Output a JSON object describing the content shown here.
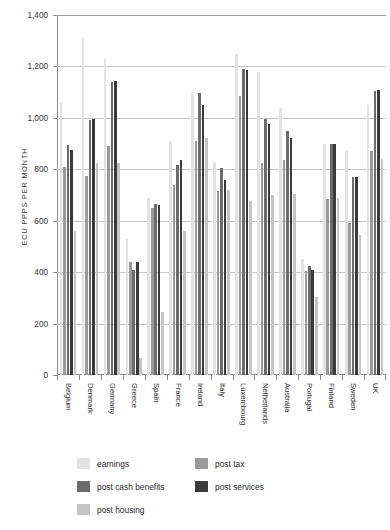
{
  "chart_data": {
    "type": "bar",
    "title": "",
    "subtitle": "",
    "xlabel": "",
    "ylabel": "ECU PPPS PER MONTH",
    "ylim": [
      0,
      1400
    ],
    "ytick_step": 200,
    "ytick_labels": [
      "1,400",
      "1,200",
      "1,000",
      "800",
      "600",
      "400",
      "200",
      "0"
    ],
    "ytick_values": [
      1400,
      1200,
      1000,
      800,
      600,
      400,
      200,
      0
    ],
    "grid": true,
    "grid_axis": "y",
    "legend_position": "below-plot",
    "categories": [
      "Belgium",
      "Denmark",
      "Germany",
      "Greece",
      "Spain",
      "France",
      "Ireland",
      "Italy",
      "Luxembourg",
      "Netherlands",
      "Australia",
      "Portugal",
      "Finland",
      "Sweden",
      "UK"
    ],
    "series": [
      {
        "name": "earnings",
        "color": "#e2e2e2",
        "values": [
          1060,
          1305,
          1230,
          530,
          690,
          910,
          1100,
          830,
          1250,
          1180,
          1040,
          450,
          900,
          870,
          1050
        ]
      },
      {
        "name": "post tax",
        "color": "#9a9a9a",
        "values": [
          810,
          775,
          890,
          440,
          650,
          740,
          910,
          715,
          1085,
          825,
          835,
          405,
          685,
          590,
          870
        ]
      },
      {
        "name": "post cash benefits",
        "color": "#6b6b6b",
        "values": [
          895,
          990,
          1140,
          410,
          665,
          815,
          1095,
          805,
          1190,
          995,
          950,
          425,
          900,
          770,
          1105
        ]
      },
      {
        "name": "post services",
        "color": "#3a3a3a",
        "values": [
          875,
          995,
          1145,
          440,
          660,
          835,
          1050,
          760,
          1185,
          975,
          920,
          410,
          900,
          770,
          1110
        ]
      },
      {
        "name": "post housing",
        "color": "#c4c4c4",
        "values": [
          560,
          825,
          825,
          65,
          245,
          560,
          920,
          720,
          675,
          700,
          705,
          305,
          690,
          545,
          840
        ]
      }
    ]
  },
  "legend": {
    "items": [
      {
        "label": "earnings",
        "swatch": "#e2e2e2"
      },
      {
        "label": "post tax",
        "swatch": "#9a9a9a"
      },
      {
        "label": "post cash benefits",
        "swatch": "#6b6b6b"
      },
      {
        "label": "post services",
        "swatch": "#3a3a3a"
      },
      {
        "label": "post housing",
        "swatch": "#c4c4c4"
      }
    ]
  }
}
